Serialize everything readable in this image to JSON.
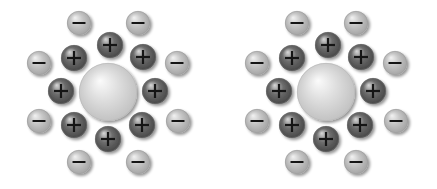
{
  "figure": {
    "background_color": "#ffffff",
    "width": 437,
    "height": 189,
    "panel_count": 2
  },
  "legend": {
    "positive_symbol": "+",
    "negative_symbol": "−",
    "positive_label": "positive ion",
    "negative_label": "negative ion",
    "core_label": "colloid particle"
  },
  "colors": {
    "background": "#ffffff",
    "positive_sphere_dark": "#3a3a3a",
    "positive_sphere_mid": "#6e6e6e",
    "positive_sphere_highlight": "#d8d8d8",
    "negative_sphere_dark": "#9a9a9a",
    "negative_sphere_mid": "#c6c6c6",
    "negative_sphere_highlight": "#f2f2f2",
    "core_sphere_dark": "#b9b9b9",
    "core_sphere_mid": "#dedede",
    "core_sphere_highlight": "#fbfbfb",
    "sign_stroke": "#151515"
  },
  "panels": [
    {
      "id": "panel-left",
      "name": "left-particle-cluster",
      "origin_x": 0,
      "center": {
        "x": 108,
        "y": 92
      },
      "core": {
        "symbol": "",
        "cx": 108,
        "cy": 92,
        "r": 29
      },
      "inner_ring": {
        "charge": "+",
        "count": 8,
        "radius": 47,
        "sphere_radius": 13,
        "ions": [
          {
            "symbol": "+",
            "cx": 110,
            "cy": 45,
            "r": 13,
            "angle_deg": 272
          },
          {
            "symbol": "+",
            "cx": 143,
            "cy": 57,
            "r": 13,
            "angle_deg": 318
          },
          {
            "symbol": "+",
            "cx": 155,
            "cy": 91,
            "r": 13,
            "angle_deg": 358
          },
          {
            "symbol": "+",
            "cx": 142,
            "cy": 125,
            "r": 13,
            "angle_deg": 42
          },
          {
            "symbol": "+",
            "cx": 108,
            "cy": 139,
            "r": 13,
            "angle_deg": 88
          },
          {
            "symbol": "+",
            "cx": 74,
            "cy": 125,
            "r": 13,
            "angle_deg": 137
          },
          {
            "symbol": "+",
            "cx": 61,
            "cy": 91,
            "r": 13,
            "angle_deg": 178
          },
          {
            "symbol": "+",
            "cx": 74,
            "cy": 58,
            "r": 13,
            "angle_deg": 222
          }
        ]
      },
      "outer_ring": {
        "charge": "−",
        "count": 8,
        "radius": 75,
        "sphere_radius": 12,
        "ions": [
          {
            "symbol": "−",
            "cx": 79,
            "cy": 23,
            "r": 12,
            "angle_deg": 249
          },
          {
            "symbol": "−",
            "cx": 138,
            "cy": 23,
            "r": 12,
            "angle_deg": 291
          },
          {
            "symbol": "−",
            "cx": 177,
            "cy": 63,
            "r": 12,
            "angle_deg": 334
          },
          {
            "symbol": "−",
            "cx": 178,
            "cy": 121,
            "r": 12,
            "angle_deg": 25
          },
          {
            "symbol": "−",
            "cx": 138,
            "cy": 162,
            "r": 12,
            "angle_deg": 68
          },
          {
            "symbol": "−",
            "cx": 79,
            "cy": 162,
            "r": 12,
            "angle_deg": 112
          },
          {
            "symbol": "−",
            "cx": 39,
            "cy": 121,
            "r": 12,
            "angle_deg": 155
          },
          {
            "symbol": "−",
            "cx": 39,
            "cy": 63,
            "r": 12,
            "angle_deg": 206
          }
        ]
      }
    },
    {
      "id": "panel-right",
      "name": "right-particle-cluster",
      "origin_x": 218,
      "center": {
        "x": 108,
        "y": 92
      },
      "core": {
        "symbol": "",
        "cx": 108,
        "cy": 92,
        "r": 29
      },
      "inner_ring": {
        "charge": "+",
        "count": 8,
        "radius": 47,
        "sphere_radius": 13,
        "ions": [
          {
            "symbol": "+",
            "cx": 110,
            "cy": 45,
            "r": 13,
            "angle_deg": 272
          },
          {
            "symbol": "+",
            "cx": 143,
            "cy": 57,
            "r": 13,
            "angle_deg": 318
          },
          {
            "symbol": "+",
            "cx": 155,
            "cy": 91,
            "r": 13,
            "angle_deg": 358
          },
          {
            "symbol": "+",
            "cx": 142,
            "cy": 125,
            "r": 13,
            "angle_deg": 42
          },
          {
            "symbol": "+",
            "cx": 108,
            "cy": 139,
            "r": 13,
            "angle_deg": 88
          },
          {
            "symbol": "+",
            "cx": 74,
            "cy": 125,
            "r": 13,
            "angle_deg": 137
          },
          {
            "symbol": "+",
            "cx": 61,
            "cy": 91,
            "r": 13,
            "angle_deg": 178
          },
          {
            "symbol": "+",
            "cx": 74,
            "cy": 58,
            "r": 13,
            "angle_deg": 222
          }
        ]
      },
      "outer_ring": {
        "charge": "−",
        "count": 8,
        "radius": 75,
        "sphere_radius": 12,
        "ions": [
          {
            "symbol": "−",
            "cx": 79,
            "cy": 23,
            "r": 12,
            "angle_deg": 249
          },
          {
            "symbol": "−",
            "cx": 138,
            "cy": 23,
            "r": 12,
            "angle_deg": 291
          },
          {
            "symbol": "−",
            "cx": 177,
            "cy": 63,
            "r": 12,
            "angle_deg": 334
          },
          {
            "symbol": "−",
            "cx": 178,
            "cy": 121,
            "r": 12,
            "angle_deg": 25
          },
          {
            "symbol": "−",
            "cx": 138,
            "cy": 162,
            "r": 12,
            "angle_deg": 68
          },
          {
            "symbol": "−",
            "cx": 79,
            "cy": 162,
            "r": 12,
            "angle_deg": 112
          },
          {
            "symbol": "−",
            "cx": 39,
            "cy": 121,
            "r": 12,
            "angle_deg": 155
          },
          {
            "symbol": "−",
            "cx": 39,
            "cy": 63,
            "r": 12,
            "angle_deg": 206
          }
        ]
      }
    }
  ]
}
